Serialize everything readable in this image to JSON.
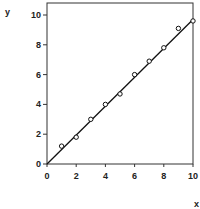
{
  "chart_data": {
    "type": "scatter",
    "title": "",
    "xlabel": "x",
    "ylabel": "y",
    "xlim": [
      0,
      10
    ],
    "ylim": [
      0,
      10.5
    ],
    "xticks": [
      0,
      2,
      4,
      6,
      8,
      10
    ],
    "yticks": [
      0,
      2,
      4,
      6,
      8,
      10
    ],
    "grid": false,
    "legend": null,
    "series": [
      {
        "name": "data points",
        "marker": "open-circle",
        "x": [
          1,
          2,
          3,
          4,
          5,
          6,
          7,
          8,
          9,
          10
        ],
        "y": [
          1.2,
          1.8,
          3.0,
          4.0,
          4.7,
          6.0,
          6.9,
          7.8,
          9.1,
          9.6
        ]
      },
      {
        "name": "fit line",
        "style": "line",
        "x": [
          0,
          10
        ],
        "y": [
          0,
          9.7
        ]
      }
    ]
  }
}
